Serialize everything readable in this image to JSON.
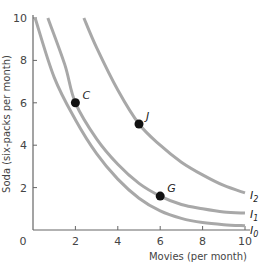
{
  "chart_data": {
    "type": "line",
    "title": "",
    "xlabel": "Movies (per month)",
    "ylabel": "Soda (six-packs per month)",
    "xlim": [
      0,
      10
    ],
    "ylim": [
      0,
      10
    ],
    "grid": false,
    "x_ticks": [
      "0",
      "2",
      "4",
      "6",
      "8",
      "10"
    ],
    "y_ticks": [
      "2",
      "4",
      "6",
      "8",
      "10"
    ],
    "series": [
      {
        "name": "I0",
        "points": [
          [
            0.1,
            10
          ],
          [
            1,
            7.2
          ],
          [
            2,
            5.2
          ],
          [
            3,
            3.6
          ],
          [
            4,
            2.4
          ],
          [
            5,
            1.5
          ],
          [
            6,
            0.9
          ],
          [
            7,
            0.55
          ],
          [
            8,
            0.35
          ],
          [
            9,
            0.25
          ],
          [
            10,
            0.2
          ]
        ]
      },
      {
        "name": "I1",
        "points": [
          [
            0.7,
            10
          ],
          [
            1.5,
            7.8
          ],
          [
            2,
            6
          ],
          [
            3,
            4.3
          ],
          [
            4,
            3.1
          ],
          [
            5,
            2.2
          ],
          [
            6,
            1.6
          ],
          [
            7,
            1.2
          ],
          [
            8,
            1.0
          ],
          [
            9,
            0.85
          ],
          [
            10,
            0.8
          ]
        ]
      },
      {
        "name": "I2",
        "points": [
          [
            2.4,
            10
          ],
          [
            3,
            8.6
          ],
          [
            4,
            6.6
          ],
          [
            5,
            5
          ],
          [
            6,
            4
          ],
          [
            7,
            3.2
          ],
          [
            8,
            2.6
          ],
          [
            9,
            2.1
          ],
          [
            10,
            1.75
          ]
        ]
      }
    ],
    "annotations": [
      {
        "label": "C",
        "x": 2,
        "y": 6
      },
      {
        "label": "J",
        "x": 5,
        "y": 5
      },
      {
        "label": "G",
        "x": 6,
        "y": 1.6
      }
    ],
    "curve_labels": [
      {
        "label": "I2",
        "base": "I",
        "sub": "2"
      },
      {
        "label": "I1",
        "base": "I",
        "sub": "1"
      },
      {
        "label": "I0",
        "base": "I",
        "sub": "0"
      }
    ]
  },
  "colors": {
    "curve": "#a8a8a8",
    "axis": "#666666",
    "point": "#111111"
  }
}
